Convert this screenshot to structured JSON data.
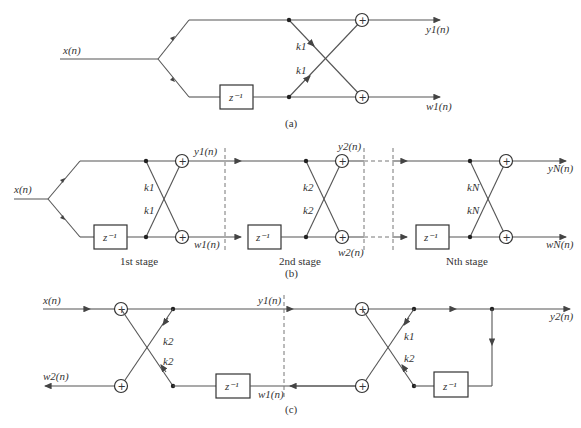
{
  "figure_a": {
    "input": "x(n)",
    "coef_top": "k1",
    "coef_bottom": "k1",
    "delay": "z⁻¹",
    "out_top": "y1(n)",
    "out_bottom": "w1(n)",
    "caption": "(a)"
  },
  "figure_b": {
    "input": "x(n)",
    "stages": [
      {
        "coef": "k1",
        "label": "1st stage",
        "out_top": "y1(n)",
        "out_bottom": "w1(n)"
      },
      {
        "coef": "k2",
        "label": "2nd stage",
        "out_top": "y2(n)",
        "out_bottom": "w2(n)"
      },
      {
        "coef": "kN",
        "label": "Nth stage",
        "out_top": "yN(n)",
        "out_bottom": "wN(n)"
      }
    ],
    "delay": "z⁻¹",
    "caption": "(b)"
  },
  "figure_c": {
    "input": "x(n)",
    "out_w2": "w2(n)",
    "mid_y1": "y1(n)",
    "mid_w1": "w1(n)",
    "out_y2": "y2(n)",
    "stage2_coefs": [
      "k2",
      "k2"
    ],
    "stage1_coefs": [
      "k1",
      "k2"
    ],
    "delay": "z⁻¹",
    "caption": "(c)"
  }
}
